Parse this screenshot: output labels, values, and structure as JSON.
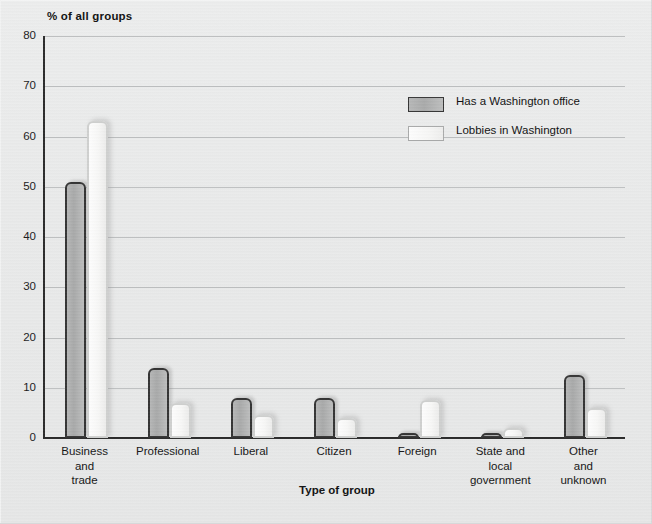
{
  "chart_data": {
    "type": "bar",
    "title": "",
    "ylabel": "% of all groups",
    "xlabel": "Type of group",
    "ylim": [
      0,
      80
    ],
    "yticks": [
      0,
      10,
      20,
      30,
      40,
      50,
      60,
      70,
      80
    ],
    "grid": true,
    "legend_position": "upper-right-inside",
    "categories": [
      "Business and trade",
      "Professional",
      "Liberal",
      "Citizen",
      "Foreign",
      "State and local government",
      "Other and unknown"
    ],
    "category_lines": [
      [
        "Business",
        "and",
        "trade"
      ],
      [
        "Professional"
      ],
      [
        "Liberal"
      ],
      [
        "Citizen"
      ],
      [
        "Foreign"
      ],
      [
        "State and",
        "local",
        "government"
      ],
      [
        "Other",
        "and",
        "unknown"
      ]
    ],
    "series": [
      {
        "name": "Has a Washington office",
        "color": "#b0b1b1",
        "values": [
          51,
          14,
          8,
          8,
          1,
          0.5,
          12.5
        ]
      },
      {
        "name": "Lobbies in Washington",
        "color": "#fafafa",
        "values": [
          63,
          7,
          4.5,
          4,
          7.5,
          2,
          6
        ]
      }
    ]
  },
  "colors": {
    "background": "#e9eaea",
    "axis": "#2b2b2b",
    "gridline": "#bdbfc0",
    "text": "#141414",
    "series_gray": "#b0b1b1",
    "series_white": "#fafafa"
  }
}
